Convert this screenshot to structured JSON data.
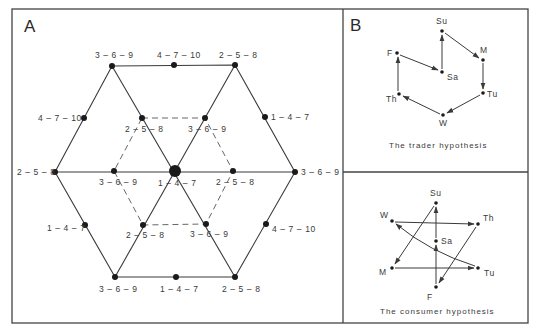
{
  "panel_a": {
    "letter": "A",
    "center_label": "1 – 4 – 7",
    "outer_vertex_labels": {
      "top_left": "3 – 6 – 9",
      "top_right": "2 – 5 – 8",
      "right": "3 – 6 – 9",
      "bottom_right": "2 – 5 – 8",
      "bottom_left": "3 – 6 – 9",
      "left": "2 – 5 – 8"
    },
    "outer_edge_labels": {
      "top": "4 – 7 – 10",
      "upper_right": "1 – 4 – 7",
      "lower_right": "4 – 7 – 10",
      "bottom": "1 – 4 – 7",
      "lower_left": "1 – 4 – 7",
      "upper_left": "4 – 7 – 10"
    },
    "inner_labels": {
      "upper_left": "2 – 5 – 8",
      "upper_right": "3 – 6 – 9",
      "right": "2 – 5 – 8",
      "lower_right": "3 – 6 – 9",
      "lower_left": "2 – 5 – 8",
      "left": "3 – 6 – 9"
    }
  },
  "panel_b": {
    "letter": "B",
    "trader": {
      "caption": "The trader hypothesis",
      "nodes": {
        "Su": "Su",
        "M": "M",
        "Tu": "Tu",
        "W": "W",
        "Th": "Th",
        "F": "F",
        "Sa": "Sa"
      },
      "sequence": [
        "Su",
        "M",
        "Tu",
        "W",
        "Th",
        "F",
        "Sa",
        "Su"
      ]
    },
    "consumer": {
      "caption": "The consumer hypothesis",
      "nodes": {
        "Su": "Su",
        "M": "M",
        "Tu": "Tu",
        "W": "W",
        "Th": "Th",
        "F": "F",
        "Sa": "Sa"
      },
      "sequence": [
        "Su",
        "M",
        "Tu",
        "W",
        "Th",
        "F",
        "Sa",
        "Su"
      ]
    }
  }
}
